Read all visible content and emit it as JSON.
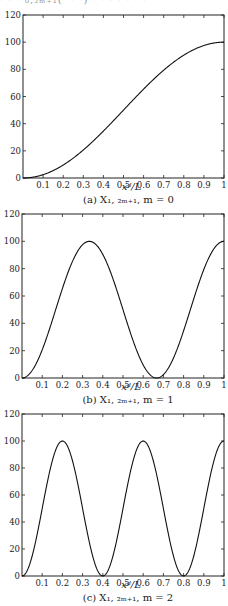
{
  "top_partial_text": "· · ·  ₀,₂ₘ₊₁(· · ·)  · · · · · · ·",
  "chart_data": [
    {
      "type": "line",
      "title": "",
      "caption": "(a) X₁, ₂ₘ₊₁, m = 0",
      "xlabel": "x_d / L",
      "ylabel": "",
      "xlim": [
        0,
        1
      ],
      "ylim": [
        0,
        120
      ],
      "xticks": [
        "0.1",
        "0.2",
        "0.3",
        "0.4",
        "0.5",
        "0.6",
        "0.7",
        "0.8",
        "0.9",
        "1"
      ],
      "yticks": [
        "0",
        "20",
        "40",
        "60",
        "80",
        "100",
        "120"
      ],
      "grid": false,
      "series": [
        {
          "name": "m=0",
          "function": "100*sin^2(pi*x/2)",
          "x": [
            0,
            0.1,
            0.2,
            0.3,
            0.4,
            0.5,
            0.6,
            0.7,
            0.8,
            0.9,
            1
          ],
          "y": [
            0,
            2.4,
            9.5,
            20.6,
            34.5,
            50,
            65.5,
            79.4,
            90.5,
            97.6,
            100
          ]
        }
      ]
    },
    {
      "type": "line",
      "caption": "(b) X₁, ₂ₘ₊₁, m = 1",
      "xlabel": "x_d / L",
      "xlim": [
        0,
        1
      ],
      "ylim": [
        0,
        120
      ],
      "xticks": [
        "0.1",
        "0.2",
        "0.3",
        "0.4",
        "0.5",
        "0.6",
        "0.7",
        "0.8",
        "0.9",
        "1"
      ],
      "yticks": [
        "0",
        "20",
        "40",
        "60",
        "80",
        "100",
        "120"
      ],
      "grid": false,
      "series": [
        {
          "name": "m=1",
          "function": "100*sin^2(3*pi*x/2)",
          "x": [
            0,
            0.1,
            0.2,
            0.333,
            0.4,
            0.5,
            0.6,
            0.667,
            0.7,
            0.8,
            0.9,
            1
          ],
          "y": [
            0,
            20.6,
            65.5,
            100,
            95.5,
            50,
            9.5,
            0,
            2.4,
            34.5,
            79.4,
            100
          ]
        }
      ]
    },
    {
      "type": "line",
      "caption": "(c) X₁, ₂ₘ₊₁, m = 2",
      "xlabel": "x_d / L",
      "xlim": [
        0,
        1
      ],
      "ylim": [
        0,
        120
      ],
      "xticks": [
        "0.1",
        "0.2",
        "0.3",
        "0.4",
        "0.5",
        "0.6",
        "0.7",
        "0.8",
        "0.9",
        "1"
      ],
      "yticks": [
        "0",
        "20",
        "40",
        "60",
        "80",
        "100",
        "120"
      ],
      "grid": false,
      "series": [
        {
          "name": "m=2",
          "function": "100*sin^2(5*pi*x/2)",
          "x": [
            0,
            0.1,
            0.2,
            0.3,
            0.4,
            0.5,
            0.6,
            0.7,
            0.8,
            0.9,
            1
          ],
          "y": [
            0,
            50,
            100,
            50,
            0,
            50,
            100,
            50,
            0,
            50,
            100
          ]
        }
      ]
    }
  ]
}
